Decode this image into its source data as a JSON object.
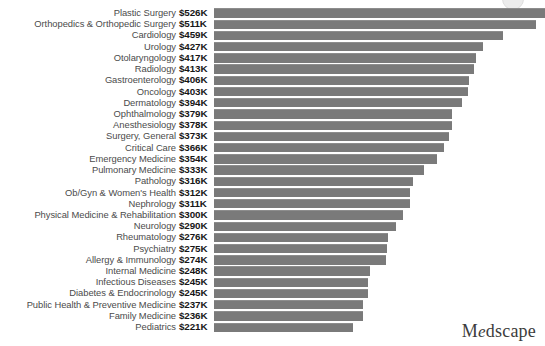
{
  "brand": {
    "logo_text": "Medscape",
    "logo_lead": "M",
    "logo_accent": "e",
    "logo_tail": "dscape"
  },
  "colors": {
    "bar_fill": "#7a7a7a",
    "bar_top_edge": "#8d8d8d",
    "label_text": "#4b4b4b",
    "value_text": "#161616",
    "background": "#ffffff",
    "logo_text": "#3c3c3c"
  },
  "chart_data": {
    "type": "bar",
    "orientation": "horizontal",
    "title": "",
    "subtitle": "",
    "xlabel": "",
    "ylabel": "",
    "grid": false,
    "legend": false,
    "value_prefix": "$",
    "value_suffix": "K",
    "value_unit": "thousands of US dollars",
    "xlim": [
      0,
      526
    ],
    "bar_axis_max": 526,
    "categories": [
      "Plastic Surgery",
      "Orthopedics & Orthopedic Surgery",
      "Cardiology",
      "Urology",
      "Otolaryngology",
      "Radiology",
      "Gastroenterology",
      "Oncology",
      "Dermatology",
      "Ophthalmology",
      "Anesthesiology",
      "Surgery, General",
      "Critical Care",
      "Emergency Medicine",
      "Pulmonary Medicine",
      "Pathology",
      "Ob/Gyn & Women's Health",
      "Nephrology",
      "Physical Medicine & Rehabilitation",
      "Neurology",
      "Rheumatology",
      "Psychiatry",
      "Allergy & Immunology",
      "Internal Medicine",
      "Infectious Diseases",
      "Diabetes & Endocrinology",
      "Public Health & Preventive Medicine",
      "Family Medicine",
      "Pediatrics"
    ],
    "values": [
      526,
      511,
      459,
      427,
      417,
      413,
      406,
      403,
      394,
      379,
      378,
      373,
      366,
      354,
      333,
      316,
      312,
      311,
      300,
      290,
      276,
      275,
      274,
      248,
      245,
      245,
      237,
      236,
      221
    ],
    "value_labels": [
      "$526K",
      "$511K",
      "$459K",
      "$427K",
      "$417K",
      "$413K",
      "$406K",
      "$403K",
      "$394K",
      "$379K",
      "$378K",
      "$373K",
      "$366K",
      "$354K",
      "$333K",
      "$316K",
      "$312K",
      "$311K",
      "$300K",
      "$290K",
      "$276K",
      "$275K",
      "$274K",
      "$248K",
      "$245K",
      "$245K",
      "$237K",
      "$236K",
      "$221K"
    ]
  }
}
